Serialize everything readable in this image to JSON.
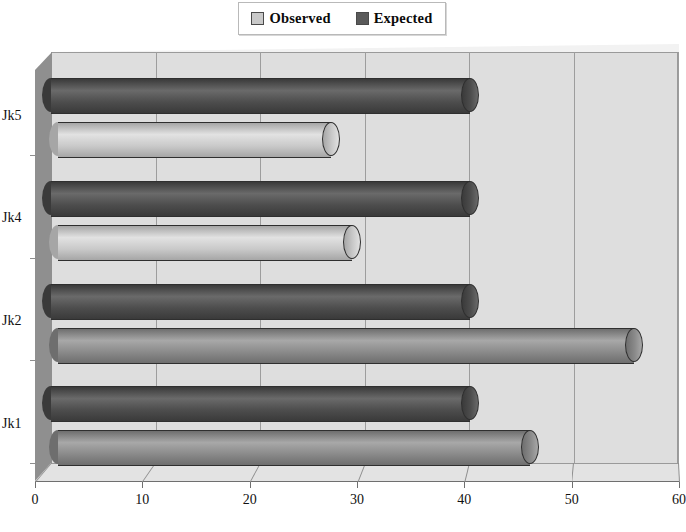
{
  "legend": {
    "position": "top-center",
    "entries": [
      {
        "label": "Observed",
        "color": "#c9c9c9",
        "swatch_name": "legend-swatch-observed"
      },
      {
        "label": "Expected",
        "color": "#5a5a5a",
        "swatch_name": "legend-swatch-expected"
      }
    ]
  },
  "axes": {
    "x_ticks": [
      "0",
      "10",
      "20",
      "30",
      "40",
      "50",
      "60"
    ],
    "y_ticks": [
      "Jk5",
      "Jk4",
      "Jk2",
      "Jk1"
    ]
  },
  "chart_data": {
    "type": "bar",
    "orientation": "horizontal",
    "style": "3d-cylinder",
    "title": "",
    "xlabel": "",
    "ylabel": "",
    "categories": [
      "Jk5",
      "Jk4",
      "Jk2",
      "Jk1"
    ],
    "xlim": [
      0,
      60
    ],
    "xticks": [
      0,
      10,
      20,
      30,
      40,
      50,
      60
    ],
    "grid": true,
    "legend_position": "top-center",
    "series": [
      {
        "name": "Observed",
        "color": "#c9c9c9",
        "values": [
          27,
          29,
          56,
          46
        ]
      },
      {
        "name": "Expected",
        "color": "#4d4d4d",
        "values": [
          41,
          41,
          41,
          41
        ]
      }
    ]
  },
  "colors": {
    "back_wall": "#dedede",
    "side_wall": "#8f8f8f",
    "floor": "#e3e3e3",
    "gridline": "#9d9d9d",
    "observed_light": "#c9c9c9",
    "observed_shaded": "#8a8a8a",
    "expected_dark": "#4d4d4d",
    "text": "#111111"
  }
}
